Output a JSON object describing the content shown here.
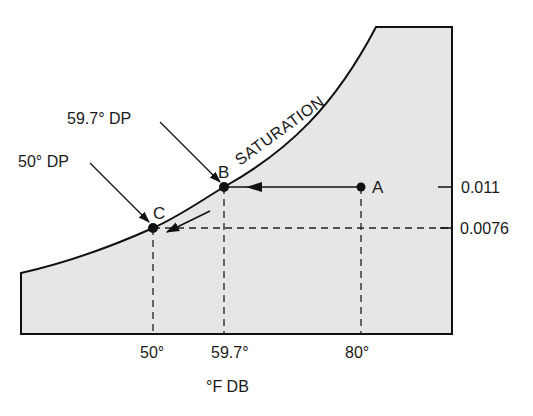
{
  "diagram": {
    "curve_label": "SATURATION",
    "points": [
      {
        "id": "A",
        "label": "A",
        "dry_bulb": "80°",
        "humidity_ratio": "0.011"
      },
      {
        "id": "B",
        "label": "B",
        "dry_bulb": "59.7°",
        "humidity_ratio": "0.011",
        "callout": "59.7° DP"
      },
      {
        "id": "C",
        "label": "C",
        "dry_bulb": "50°",
        "humidity_ratio": "0.0076",
        "callout": "50° DP"
      }
    ],
    "x_axis": {
      "label": "°F DB",
      "ticks": [
        "50°",
        "59.7°",
        "80°"
      ]
    },
    "y_axis": {
      "ticks": [
        "0.011",
        "0.0076"
      ]
    },
    "colors": {
      "fill": "#e6e6e6",
      "stroke": "#111111"
    }
  }
}
